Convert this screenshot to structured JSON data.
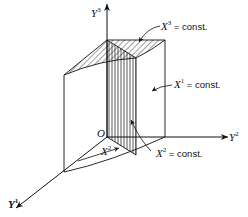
{
  "figure": {
    "type": "3d-coordinate-diagram",
    "axes": {
      "y1": {
        "base": "Y",
        "sup": "1"
      },
      "y2": {
        "base": "Y",
        "sup": "2"
      },
      "y3": {
        "base": "Y",
        "sup": "3"
      }
    },
    "origin_label": "O",
    "surfaces": {
      "x1": {
        "base": "X",
        "sup": "1",
        "eq": " = const."
      },
      "x2": {
        "base": "X",
        "sup": "2",
        "eq": " = const."
      },
      "x3": {
        "base": "X",
        "sup": "3",
        "eq": " = const."
      }
    },
    "angle_label": {
      "base": "X",
      "sup": "2"
    },
    "colors": {
      "line": "#111111",
      "background": "#ffffff"
    }
  }
}
